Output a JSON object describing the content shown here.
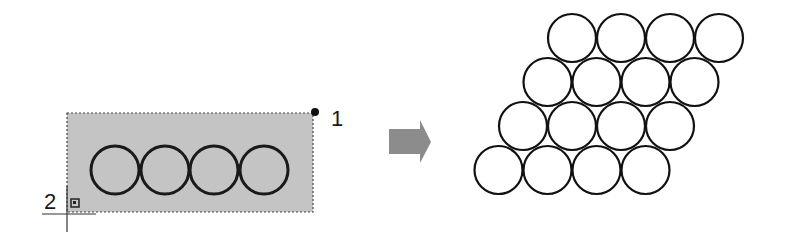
{
  "diagram": {
    "source": {
      "selection_rect": {
        "x": 67,
        "y": 113,
        "width": 246,
        "height": 99,
        "fill": "#c4c4c4",
        "border": "#555555"
      },
      "circles": [
        {
          "cx": 115,
          "cy": 170,
          "r": 24
        },
        {
          "cx": 165,
          "cy": 170,
          "r": 24
        },
        {
          "cx": 214,
          "cy": 170,
          "r": 24
        },
        {
          "cx": 264,
          "cy": 170,
          "r": 24
        }
      ],
      "point_1": {
        "x": 315,
        "y": 112,
        "label": "1"
      },
      "point_2": {
        "x": 67,
        "y": 214,
        "label": "2"
      }
    },
    "arrow": {
      "color": "#8c8c8c"
    },
    "result": {
      "rows": 4,
      "cols": 4,
      "radius": 24,
      "col_spacing": 49,
      "row_spacing": 44,
      "row_shift": 24.5,
      "top_row_first_cx": 572,
      "top_row_cy": 38,
      "stroke": "#111111"
    }
  },
  "labels": {
    "point_1": "1",
    "point_2": "2"
  }
}
